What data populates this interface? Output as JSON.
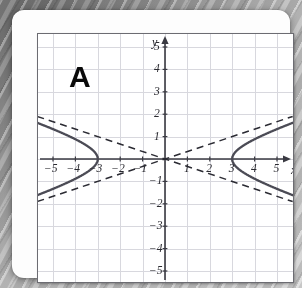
{
  "figure": {
    "panel_label": "A",
    "axis_labels": {
      "x": "x",
      "y": "y"
    },
    "x_tick_labels": [
      "−5",
      "−4",
      "−3",
      "−2",
      "−1",
      "1",
      "2",
      "3",
      "4",
      "5"
    ],
    "y_tick_labels": [
      "5",
      "4",
      "3",
      "2",
      "1",
      "−1",
      "−2",
      "−3",
      "−4",
      "−5"
    ],
    "colors": {
      "curve": "#4b4b55",
      "asymptote": "#2b2b33",
      "axis": "#3a3a42",
      "grid": "#d8d8de",
      "frame": "#6c6c72",
      "card": "#fdfdfd",
      "background": "#9a9a9a",
      "label": "#0a0a0a"
    }
  },
  "chart_data": {
    "type": "line",
    "title": "A",
    "xlabel": "x",
    "ylabel": "y",
    "xlim": [
      -5.7,
      5.7
    ],
    "ylim": [
      -5.6,
      5.6
    ],
    "grid": true,
    "legend": "none",
    "curve_kind": "hyperbola",
    "equation": "x^2/9 - y^2/1 = 1",
    "center": [
      0,
      0
    ],
    "a": 3,
    "b": 1,
    "vertices": [
      [
        -3,
        0
      ],
      [
        3,
        0
      ]
    ],
    "opens": "horizontal",
    "asymptote_slopes": [
      0.3333,
      -0.3333
    ],
    "x_ticks": [
      -5,
      -4,
      -3,
      -2,
      -1,
      1,
      2,
      3,
      4,
      5
    ],
    "y_ticks": [
      5,
      4,
      3,
      2,
      1,
      -1,
      -2,
      -3,
      -4,
      -5
    ],
    "series": [
      {
        "name": "hyperbola-right-branch",
        "style": "solid",
        "x": [
          3.0,
          3.05,
          3.2,
          3.5,
          4.0,
          4.5,
          5.0,
          5.5,
          5.7
        ],
        "y_upper": [
          0.0,
          0.18,
          0.37,
          0.6,
          0.88,
          1.12,
          1.33,
          1.54,
          1.62
        ],
        "y_lower": [
          0.0,
          -0.18,
          -0.37,
          -0.6,
          -0.88,
          -1.12,
          -1.33,
          -1.54,
          -1.62
        ]
      },
      {
        "name": "hyperbola-left-branch",
        "style": "solid",
        "x": [
          -3.0,
          -3.05,
          -3.2,
          -3.5,
          -4.0,
          -4.5,
          -5.0,
          -5.5,
          -5.7
        ],
        "y_upper": [
          0.0,
          0.18,
          0.37,
          0.6,
          0.88,
          1.12,
          1.33,
          1.54,
          1.62
        ],
        "y_lower": [
          0.0,
          -0.18,
          -0.37,
          -0.6,
          -0.88,
          -1.12,
          -1.33,
          -1.54,
          -1.62
        ]
      },
      {
        "name": "asymptote-positive-slope",
        "style": "dashed",
        "x": [
          -5.7,
          5.7
        ],
        "y": [
          -1.9,
          1.9
        ]
      },
      {
        "name": "asymptote-negative-slope",
        "style": "dashed",
        "x": [
          -5.7,
          5.7
        ],
        "y": [
          1.9,
          -1.9
        ]
      }
    ]
  }
}
